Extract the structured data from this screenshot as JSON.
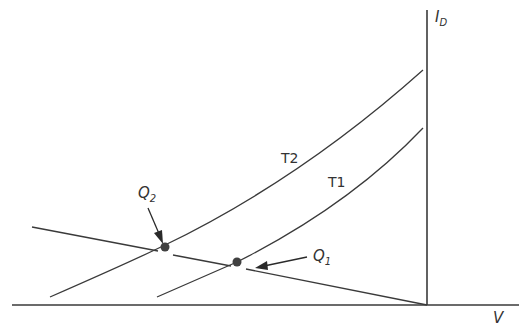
{
  "diagram": {
    "type": "diode I-V characteristic with load line",
    "axes": {
      "y_label": "I",
      "y_label_sub": "D",
      "x_label": "V"
    },
    "curves": [
      {
        "name": "T2",
        "label": "T2"
      },
      {
        "name": "T1",
        "label": "T1"
      }
    ],
    "load_line": {
      "description": "load line intersecting both curves"
    },
    "operating_points": [
      {
        "name": "Q2",
        "label": "Q",
        "sub": "2",
        "on_curve": "T2"
      },
      {
        "name": "Q1",
        "label": "Q",
        "sub": "1",
        "on_curve": "T1"
      }
    ],
    "colors": {
      "line": "#3a3a3a",
      "dot": "#404040",
      "background": "#ffffff"
    }
  }
}
